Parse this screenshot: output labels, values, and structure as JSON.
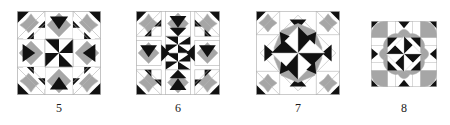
{
  "figure": {
    "background": "#ffffff",
    "palette": {
      "dark": "#111111",
      "medium": "#a6a6a6",
      "light": "#ffffff",
      "outline": "#b5b5b5",
      "caption": "#1a1a1a"
    },
    "blocks": [
      {
        "caption": "5",
        "name": "quilt-block-5",
        "size": 84,
        "left": 14,
        "top": 11,
        "caption_top": 102,
        "layout": "on-point nine patch, pinwheel center, square-in-square corners",
        "center_motif": "black-white pinwheel",
        "side_motif": "gray diamond with black triangle",
        "corner_motif": "gray curved star with black corner triangle"
      },
      {
        "caption": "6",
        "name": "quilt-block-6",
        "size": 84,
        "left": 132,
        "top": 11,
        "caption_top": 102,
        "layout": "on-point nine patch with elongated center column",
        "center_motif": "black-white double pinwheel",
        "side_motif": "gray diamond with black triangles",
        "corner_motif": "gray curved star with black corner triangle"
      },
      {
        "caption": "7",
        "name": "quilt-block-7",
        "size": 84,
        "left": 252,
        "top": 11,
        "caption_top": 102,
        "layout": "on-point medallion with pinwheel star center",
        "center_motif": "eight point pinwheel star on gray octagon",
        "side_motif": "gray wedge with black triangle",
        "corner_motif": "gray curved star with black corner triangle"
      },
      {
        "caption": "8",
        "name": "quilt-block-8",
        "size": 66,
        "left": 372,
        "top": 21,
        "caption_top": 102,
        "layout": "square grid, four patch pinwheel with orange peel ring",
        "center_motif": "eight point pinwheel star",
        "side_motif": "gray orange peel with black triangle",
        "corner_motif": "gray orange peel with black corner triangle"
      }
    ]
  }
}
